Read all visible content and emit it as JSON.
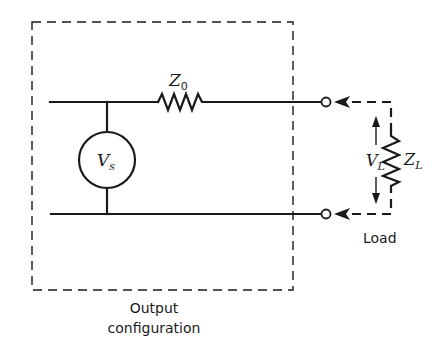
{
  "diagram": {
    "type": "circuit-schematic",
    "source_box": {
      "caption_line1": "Output",
      "caption_line2": "configuration"
    },
    "components": {
      "source": {
        "label_main": "V",
        "label_sub": "s"
      },
      "source_impedance": {
        "label_main": "Z",
        "label_sub": "0"
      },
      "load_impedance": {
        "label_main": "Z",
        "label_sub": "L"
      },
      "load_voltage": {
        "label_main": "V",
        "label_sub": "L"
      }
    },
    "load_label": "Load",
    "colors": {
      "ink": "#1a1a1a",
      "background": "#ffffff"
    }
  }
}
